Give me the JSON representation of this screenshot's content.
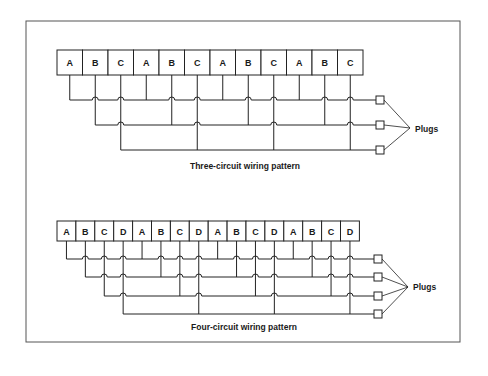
{
  "figures": [
    {
      "id": "three-circuit",
      "caption": "Three-circuit wiring pattern",
      "outlets": [
        "A",
        "B",
        "C",
        "A",
        "B",
        "C",
        "A",
        "B",
        "C",
        "A",
        "B",
        "C"
      ],
      "plugs_label": "Plugs",
      "plug_count": 3
    },
    {
      "id": "four-circuit",
      "caption": "Four-circuit wiring pattern",
      "outlets": [
        "A",
        "B",
        "C",
        "D",
        "A",
        "B",
        "C",
        "D",
        "A",
        "B",
        "C",
        "D",
        "A",
        "B",
        "C",
        "D"
      ],
      "plugs_label": "Plugs",
      "plug_count": 4
    }
  ]
}
